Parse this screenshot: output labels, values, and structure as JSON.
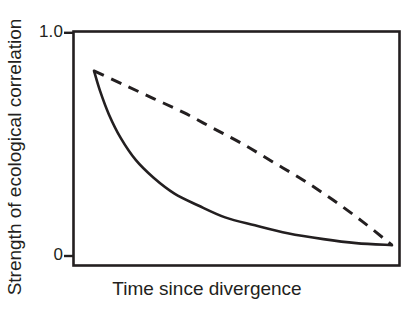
{
  "chart_data": {
    "type": "line",
    "title": "",
    "xlabel": "Time since divergence",
    "ylabel": "Strength of ecological correlation",
    "ylim": [
      0,
      1.0
    ],
    "xlim": [
      0,
      1
    ],
    "grid": false,
    "legend_position": "none",
    "yticks": [
      "0",
      "1.0"
    ],
    "ytick_values": [
      0,
      1.0
    ],
    "xticks": [],
    "series": [
      {
        "name": "solid-curve",
        "style": "solid",
        "color": "#231f20",
        "x": [
          0.0,
          0.02,
          0.05,
          0.09,
          0.14,
          0.2,
          0.27,
          0.35,
          0.44,
          0.54,
          0.65,
          0.77,
          0.88,
          1.0
        ],
        "y": [
          0.92,
          0.82,
          0.7,
          0.58,
          0.47,
          0.38,
          0.3,
          0.24,
          0.18,
          0.14,
          0.1,
          0.07,
          0.05,
          0.04
        ]
      },
      {
        "name": "dashed-curve",
        "style": "dashed",
        "color": "#231f20",
        "x": [
          0.0,
          0.1,
          0.2,
          0.3,
          0.4,
          0.5,
          0.6,
          0.7,
          0.8,
          0.9,
          1.0
        ],
        "y": [
          0.92,
          0.85,
          0.78,
          0.71,
          0.63,
          0.55,
          0.46,
          0.37,
          0.27,
          0.16,
          0.04
        ]
      }
    ],
    "axis_color": "#231f20",
    "background": "#ffffff"
  },
  "labels": {
    "y_top": "1.0",
    "y_bottom": "0",
    "y_axis_title": "Strength of ecological correlation",
    "x_axis_title": "Time since divergence"
  }
}
